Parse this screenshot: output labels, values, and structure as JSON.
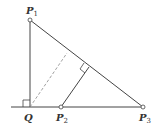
{
  "diagram": {
    "type": "geometry",
    "points": {
      "P1": {
        "label": "P",
        "sub": "1",
        "x": 30,
        "y": 20
      },
      "Q": {
        "label": "Q",
        "sub": "",
        "x": 30,
        "y": 107
      },
      "P2": {
        "label": "P",
        "sub": "2",
        "x": 61,
        "y": 107
      },
      "P3": {
        "label": "P",
        "sub": "3",
        "x": 143,
        "y": 107
      }
    },
    "colors": {
      "line": "#444444",
      "dashed": "#888888",
      "background": "#ffffff"
    }
  }
}
